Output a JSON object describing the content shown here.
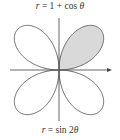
{
  "figure": {
    "top_label": {
      "var": "r",
      "equals": " = 1 + cos ",
      "theta": "θ"
    },
    "bottom_label": {
      "var": "r",
      "equals": " = sin 2",
      "theta": "θ"
    },
    "colors": {
      "curve": "#555555",
      "axis": "#555555",
      "shade": "#d9d9d9",
      "text": "#333333"
    }
  },
  "chart_data": {
    "type": "polar",
    "title_top": "r = 1 + cos θ",
    "title_bottom": "r = sin 2θ",
    "curves": [
      {
        "name": "r = sin 2θ",
        "equation": "sin(2*theta)",
        "theta_range": [
          0,
          6.283185307
        ],
        "petals": 4
      }
    ],
    "shaded_region": {
      "description": "first-quadrant petal of r = sin 2θ",
      "theta_range": [
        0,
        1.570796327
      ]
    },
    "layout": {
      "origin_px": [
        59,
        70
      ],
      "scale_px": 58,
      "x_axis_px": [
        10,
        112
      ],
      "y_axis_px": [
        18,
        121
      ],
      "x_axis_arrow": true,
      "y_axis_arrow": false,
      "grid": false
    }
  }
}
